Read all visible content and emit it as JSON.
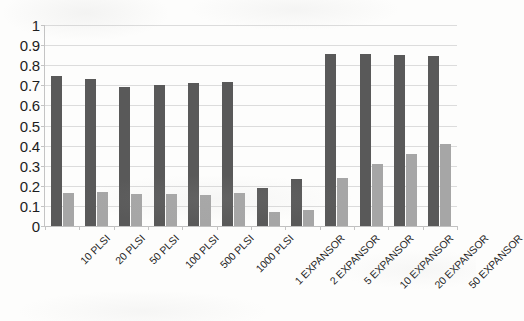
{
  "chart_data": {
    "type": "bar",
    "title": "",
    "subtitle": "",
    "xlabel": "",
    "ylabel": "",
    "ylim": [
      0,
      1
    ],
    "yticks": [
      "0",
      "0.1",
      "0.2",
      "0.3",
      "0.4",
      "0.5",
      "0.6",
      "0.7",
      "0.8",
      "0.9",
      "1"
    ],
    "ytick_values": [
      0,
      0.1,
      0.2,
      0.3,
      0.4,
      0.5,
      0.6,
      0.7,
      0.8,
      0.9,
      1
    ],
    "grid": "horizontal",
    "legend": "none",
    "categories": [
      "10 PLSI",
      "20 PLSI",
      "50 PLSI",
      "100 PLSI",
      "500 PLSI",
      "1000 PLSI",
      "1 EXPANSOR",
      "2 EXPANSOR",
      "5 EXPANSOR",
      "10 EXPANSOR",
      "20 EXPANSOR",
      "50 EXPANSOR"
    ],
    "series": [
      {
        "name": "series-a",
        "color": "#595959",
        "values": [
          0.745,
          0.73,
          0.69,
          0.7,
          0.71,
          0.715,
          0.19,
          0.235,
          0.855,
          0.855,
          0.85,
          0.845
        ]
      },
      {
        "name": "series-b",
        "color": "#a6a6a6",
        "values": [
          0.165,
          0.17,
          0.16,
          0.16,
          0.155,
          0.165,
          0.07,
          0.08,
          0.24,
          0.31,
          0.36,
          0.41
        ]
      }
    ]
  },
  "colors": {
    "series_a": "#595959",
    "series_b": "#a6a6a6",
    "gridline": "#dcdcdc",
    "axis": "#c4c4c4",
    "background": "#fdfdfc",
    "text": "#1d1d1d"
  }
}
